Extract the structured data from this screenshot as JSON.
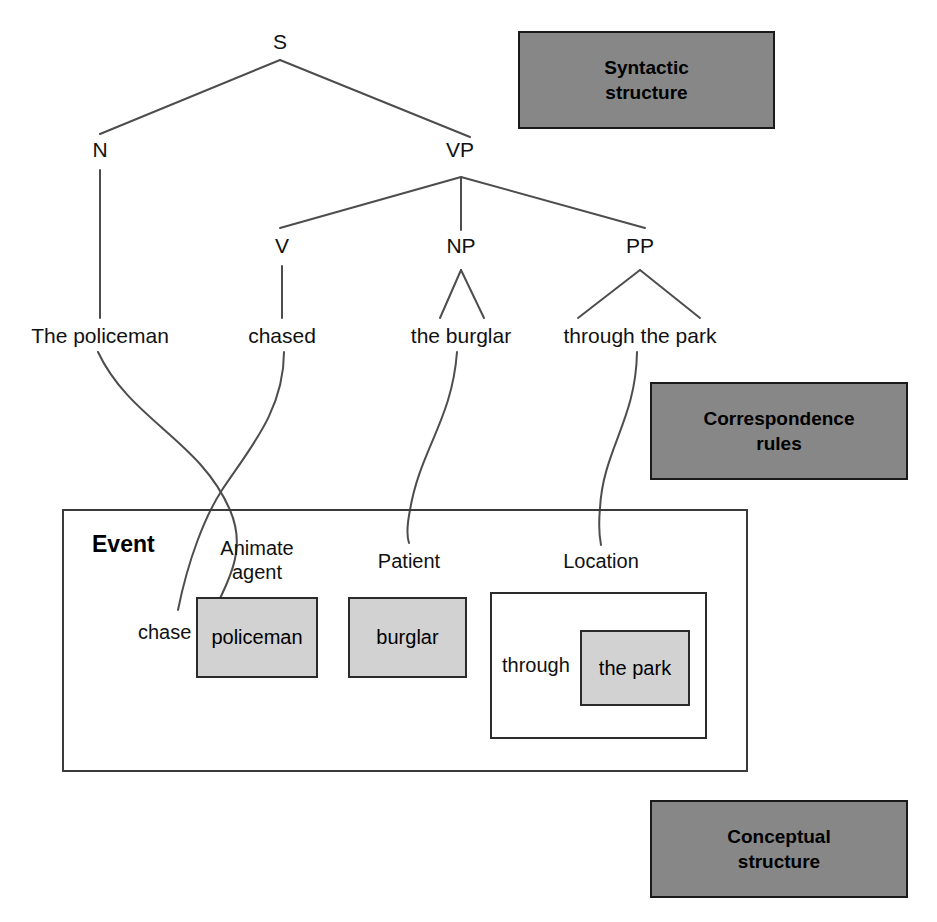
{
  "figure": {
    "sentence": "The policeman chased the burglar through the park"
  },
  "legend_boxes": [
    {
      "id": "syntactic",
      "label": "Syntactic\nstructure",
      "line1": "Syntactic",
      "line2": "structure",
      "fill": "#878787",
      "border": "#1a1a1a"
    },
    {
      "id": "correspondence",
      "label": "Correspondence\nrules",
      "line1": "Correspondence",
      "line2": "rules",
      "fill": "#878787",
      "border": "#1a1a1a"
    },
    {
      "id": "conceptual",
      "label": "Conceptual\nstructure",
      "line1": "Conceptual",
      "line2": "structure",
      "fill": "#878787",
      "border": "#1a1a1a"
    }
  ],
  "syntax_tree": {
    "root": "S",
    "nodes": [
      {
        "id": "S",
        "label": "S",
        "x": 280,
        "y": 44
      },
      {
        "id": "N",
        "label": "N",
        "x": 100,
        "y": 152
      },
      {
        "id": "VP",
        "label": "VP",
        "x": 460,
        "y": 152
      },
      {
        "id": "V",
        "label": "V",
        "x": 282,
        "y": 248
      },
      {
        "id": "NP",
        "label": "NP",
        "x": 461,
        "y": 248
      },
      {
        "id": "PP",
        "label": "PP",
        "x": 640,
        "y": 248
      }
    ],
    "leaves": [
      {
        "id": "leaf-the-policeman",
        "label": "The policeman",
        "x": 100,
        "y": 338
      },
      {
        "id": "leaf-chased",
        "label": "chased",
        "x": 282,
        "y": 338
      },
      {
        "id": "leaf-the-burglar",
        "label": "the burglar",
        "x": 461,
        "y": 338
      },
      {
        "id": "leaf-through-the-park",
        "label": "through the park",
        "x": 640,
        "y": 338
      }
    ],
    "edges": [
      {
        "from": "S",
        "to": "N"
      },
      {
        "from": "S",
        "to": "VP"
      },
      {
        "from": "VP",
        "to": "V"
      },
      {
        "from": "VP",
        "to": "NP"
      },
      {
        "from": "VP",
        "to": "PP"
      },
      {
        "from": "N",
        "to": "leaf-the-policeman"
      },
      {
        "from": "V",
        "to": "leaf-chased"
      },
      {
        "from": "NP",
        "to": "leaf-the-burglar"
      },
      {
        "from": "PP",
        "to": "leaf-through-the-park"
      }
    ]
  },
  "conceptual_structure": {
    "event_title": "Event",
    "roles": [
      {
        "id": "animate-agent",
        "label_line1": "Animate",
        "label_line2": "agent",
        "filler": "policeman"
      },
      {
        "id": "patient",
        "label_line1": "Patient",
        "label_line2": "",
        "filler": "burglar"
      },
      {
        "id": "location",
        "label_line1": "Location",
        "label_line2": "",
        "preposition": "through",
        "filler": "the park"
      }
    ],
    "predicate": "chase"
  },
  "correspondence_links": [
    {
      "from": "The policeman",
      "to": "policeman"
    },
    {
      "from": "chased",
      "to": "chase"
    },
    {
      "from": "the burglar",
      "to": "burglar"
    },
    {
      "from": "through the park",
      "to": "Location"
    }
  ],
  "colors": {
    "legend_fill": "#878787",
    "filler_fill": "#d2d2d2",
    "line": "#4d4d4d",
    "border": "#2b2b2b",
    "background": "#ffffff"
  }
}
